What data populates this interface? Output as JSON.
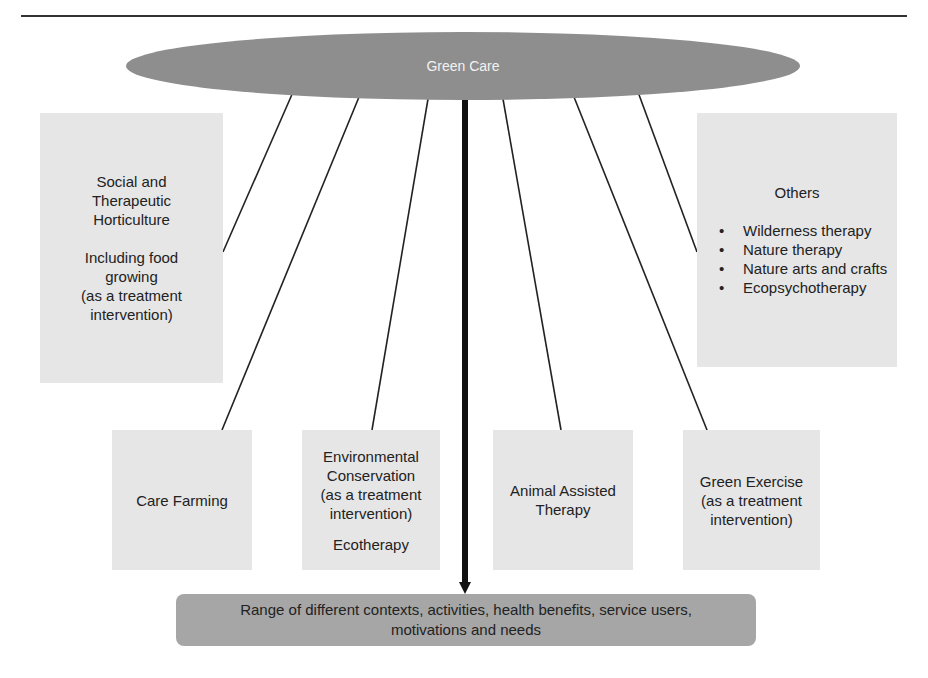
{
  "diagram": {
    "root": {
      "label": "Green Care"
    },
    "nodes": [
      {
        "id": "horticulture",
        "lines": [
          "Social and",
          "Therapeutic",
          "Horticulture"
        ],
        "sublines": [
          "Including food",
          "growing",
          "(as a treatment",
          "intervention)"
        ]
      },
      {
        "id": "care-farming",
        "lines": [
          "Care Farming"
        ]
      },
      {
        "id": "environmental-conservation",
        "lines": [
          "Environmental",
          "Conservation",
          "(as a treatment",
          "intervention)"
        ],
        "sublines": [
          "Ecotherapy"
        ]
      },
      {
        "id": "animal-assisted-therapy",
        "lines": [
          "Animal Assisted",
          "Therapy"
        ]
      },
      {
        "id": "green-exercise",
        "lines": [
          "Green Exercise",
          "(as a treatment",
          "intervention)"
        ]
      },
      {
        "id": "others",
        "title": "Others",
        "items": [
          "Wilderness therapy",
          "Nature therapy",
          "Nature arts and crafts",
          "Ecopsychotherapy"
        ]
      }
    ],
    "outcome": {
      "line1": "Range of different contexts, activities, health benefits, service users,",
      "line2": "motivations and needs"
    },
    "colors": {
      "root_fill": "#8e8e8e",
      "node_fill": "#e6e6e6",
      "outcome_fill": "#a6a6a6",
      "connector": "#222222"
    }
  }
}
